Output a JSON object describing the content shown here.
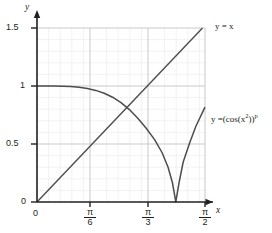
{
  "chart_data": {
    "type": "line",
    "title": "",
    "xlabel": "x",
    "ylabel": "y",
    "xlim": [
      0,
      1.5708
    ],
    "ylim": [
      0,
      1.55
    ],
    "grid": true,
    "legend_position": "inline-right",
    "x_tick_labels": [
      "0",
      "π/6",
      "π/3",
      "π/2"
    ],
    "x_tick_values": [
      0,
      0.5236,
      1.0472,
      1.5708
    ],
    "y_tick_labels": [
      "0",
      "0.5",
      "1",
      "1.5"
    ],
    "y_tick_values": [
      0,
      0.5,
      1,
      1.5
    ],
    "series": [
      {
        "name": "y = x",
        "label": "y = x",
        "color": "#4d4d4d",
        "x": [
          0.0,
          0.0785,
          0.1571,
          0.2356,
          0.3142,
          0.3927,
          0.4712,
          0.5498,
          0.6283,
          0.7069,
          0.7854,
          0.8639,
          0.9425,
          1.021,
          1.0996,
          1.1781,
          1.2566,
          1.3352,
          1.4137,
          1.4923,
          1.5
        ],
        "y": [
          0.0,
          0.0785,
          0.1571,
          0.2356,
          0.3142,
          0.3927,
          0.4712,
          0.5498,
          0.6283,
          0.7069,
          0.7854,
          0.8639,
          0.9425,
          1.021,
          1.0996,
          1.1781,
          1.2566,
          1.3352,
          1.4137,
          1.4923,
          1.5
        ]
      },
      {
        "name": "y = (cos(x^2))^p",
        "label_html": "y =(cos(x<sup>2</sup>))<sup>p</sup>",
        "color": "#4d4d4d",
        "x": [
          0.0,
          0.0785,
          0.1571,
          0.2356,
          0.3142,
          0.3927,
          0.4712,
          0.5498,
          0.6283,
          0.7069,
          0.7854,
          0.8639,
          0.9425,
          1.021,
          1.0996,
          1.1781,
          1.2199,
          1.2533,
          1.2566,
          1.2867,
          1.3352,
          1.4137,
          1.4923,
          1.5708
        ],
        "y": [
          1.0,
          1.0,
          0.9999,
          0.9995,
          0.9985,
          0.9962,
          0.9918,
          0.9843,
          0.9723,
          0.9541,
          0.9277,
          0.8908,
          0.841,
          0.7758,
          0.6929,
          0.5909,
          0.5203,
          0.4561,
          0.4493,
          0.0,
          0.0736,
          0.2604,
          0.4589,
          0.6801
        ]
      }
    ],
    "annotations": [
      {
        "text": "y = x",
        "x": 1.5708,
        "y": 1.5
      },
      {
        "text": "y =(cos(x^2))^p",
        "x": 1.5708,
        "y": 0.68
      }
    ]
  },
  "axes": {
    "x_axis_name": "x",
    "y_axis_name": "y"
  },
  "ticks": {
    "y": [
      {
        "label": "1.5"
      },
      {
        "label": "1"
      },
      {
        "label": "0.5"
      },
      {
        "label": "0"
      }
    ],
    "x": [
      {
        "label": "0",
        "type": "plain"
      },
      {
        "num": "π",
        "den": "6",
        "type": "fraction"
      },
      {
        "num": "π",
        "den": "3",
        "type": "fraction"
      },
      {
        "num": "π",
        "den": "2",
        "type": "fraction"
      }
    ]
  },
  "labels": {
    "line_label": "y = x",
    "curve_label_plain": "y =(cos(x2))p"
  },
  "colors": {
    "curve": "#4d4d4d",
    "axis": "#231f20",
    "grid_minor": "#ececec",
    "grid_major": "#cccccc",
    "background": "#ffffff",
    "text": "#231f20"
  }
}
